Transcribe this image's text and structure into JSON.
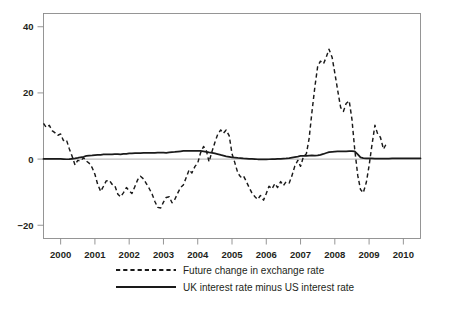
{
  "chart_data": {
    "type": "line",
    "title": "",
    "subtitle": "",
    "xlabel": "",
    "ylabel": "",
    "xlim": [
      1999.5,
      2010.5
    ],
    "ylim": [
      -24,
      44
    ],
    "yticks": [
      -20,
      0,
      20,
      40
    ],
    "ytick_labels": [
      "−20",
      "0",
      "20",
      "40"
    ],
    "xticks": [
      2000,
      2001,
      2002,
      2003,
      2004,
      2005,
      2006,
      2007,
      2008,
      2009,
      2010
    ],
    "xtick_labels": [
      "2000",
      "2001",
      "2002",
      "2003",
      "2004",
      "2005",
      "2006",
      "2007",
      "2008",
      "2009",
      "2010"
    ],
    "grid": false,
    "zero_reference_line": true,
    "legend_position": "below-axes",
    "series": [
      {
        "name": "Future change in exchange rate",
        "style": "dashed",
        "color": "#1a1a1a",
        "x": [
          1999.5,
          1999.58,
          1999.67,
          1999.75,
          1999.83,
          1999.92,
          2000.0,
          2000.08,
          2000.17,
          2000.25,
          2000.33,
          2000.42,
          2000.5,
          2000.58,
          2000.67,
          2000.75,
          2000.83,
          2000.92,
          2001.0,
          2001.08,
          2001.17,
          2001.25,
          2001.33,
          2001.42,
          2001.5,
          2001.58,
          2001.67,
          2001.75,
          2001.83,
          2001.92,
          2002.0,
          2002.08,
          2002.17,
          2002.25,
          2002.33,
          2002.42,
          2002.5,
          2002.58,
          2002.67,
          2002.75,
          2002.83,
          2002.92,
          2003.0,
          2003.08,
          2003.17,
          2003.25,
          2003.33,
          2003.42,
          2003.5,
          2003.58,
          2003.67,
          2003.75,
          2003.83,
          2003.92,
          2004.0,
          2004.08,
          2004.17,
          2004.25,
          2004.33,
          2004.42,
          2004.5,
          2004.58,
          2004.67,
          2004.75,
          2004.83,
          2004.92,
          2005.0,
          2005.08,
          2005.17,
          2005.25,
          2005.33,
          2005.42,
          2005.5,
          2005.58,
          2005.67,
          2005.75,
          2005.83,
          2005.92,
          2006.0,
          2006.08,
          2006.17,
          2006.25,
          2006.33,
          2006.42,
          2006.5,
          2006.58,
          2006.67,
          2006.75,
          2006.83,
          2006.92,
          2007.0,
          2007.08,
          2007.17,
          2007.25,
          2007.33,
          2007.42,
          2007.5,
          2007.58,
          2007.67,
          2007.75,
          2007.83,
          2007.92,
          2008.0,
          2008.08,
          2008.17,
          2008.25,
          2008.33,
          2008.42,
          2008.5,
          2008.58,
          2008.67,
          2008.75,
          2008.83,
          2008.92,
          2009.0,
          2009.08,
          2009.17,
          2009.25,
          2009.33,
          2009.42,
          2009.5
        ],
        "y": [
          10.8,
          9.6,
          10.2,
          8.6,
          8.0,
          7.2,
          7.6,
          5.6,
          5.8,
          3.2,
          1.0,
          -1.8,
          -0.4,
          -0.6,
          0.4,
          -0.6,
          -1.2,
          -2.6,
          -4.6,
          -7.6,
          -9.8,
          -8.2,
          -6.6,
          -6.4,
          -7.6,
          -8.0,
          -10.6,
          -11.4,
          -10.2,
          -8.6,
          -9.6,
          -10.4,
          -8.2,
          -6.2,
          -5.2,
          -6.0,
          -7.4,
          -8.8,
          -10.6,
          -12.8,
          -14.6,
          -14.8,
          -13.0,
          -11.6,
          -11.4,
          -13.2,
          -12.2,
          -10.2,
          -8.6,
          -7.8,
          -5.4,
          -3.2,
          -4.2,
          -2.2,
          -1.2,
          1.8,
          3.8,
          2.6,
          -0.8,
          2.4,
          5.0,
          7.4,
          8.8,
          7.8,
          8.8,
          7.0,
          1.6,
          -1.0,
          -4.2,
          -5.4,
          -5.0,
          -6.8,
          -8.6,
          -10.2,
          -11.4,
          -12.2,
          -11.0,
          -12.4,
          -10.4,
          -8.2,
          -9.0,
          -7.4,
          -8.6,
          -6.8,
          -8.0,
          -6.8,
          -7.2,
          -5.0,
          -2.2,
          -0.4,
          -2.2,
          0.6,
          1.6,
          6.2,
          14.0,
          22.0,
          28.0,
          29.6,
          28.8,
          30.8,
          33.2,
          30.8,
          26.0,
          21.0,
          15.6,
          14.4,
          16.8,
          17.6,
          12.0,
          3.0,
          -5.0,
          -9.2,
          -10.2,
          -7.0,
          -2.0,
          4.0,
          10.2,
          7.6,
          6.6,
          3.0,
          4.6
        ]
      },
      {
        "name": "UK interest rate minus US interest rate",
        "style": "solid",
        "color": "#1a1a1a",
        "x": [
          1999.5,
          1999.58,
          1999.67,
          1999.75,
          1999.83,
          1999.92,
          2000.0,
          2000.08,
          2000.17,
          2000.25,
          2000.33,
          2000.42,
          2000.5,
          2000.58,
          2000.67,
          2000.75,
          2000.83,
          2000.92,
          2001.0,
          2001.08,
          2001.17,
          2001.25,
          2001.33,
          2001.42,
          2001.5,
          2001.58,
          2001.67,
          2001.75,
          2001.83,
          2001.92,
          2002.0,
          2002.08,
          2002.17,
          2002.25,
          2002.33,
          2002.42,
          2002.5,
          2002.58,
          2002.67,
          2002.75,
          2002.83,
          2002.92,
          2003.0,
          2003.08,
          2003.17,
          2003.25,
          2003.33,
          2003.42,
          2003.5,
          2003.58,
          2003.67,
          2003.75,
          2003.83,
          2003.92,
          2004.0,
          2004.08,
          2004.17,
          2004.25,
          2004.33,
          2004.42,
          2004.5,
          2004.58,
          2004.67,
          2004.75,
          2004.83,
          2004.92,
          2005.0,
          2005.08,
          2005.17,
          2005.25,
          2005.33,
          2005.42,
          2005.5,
          2005.58,
          2005.67,
          2005.75,
          2005.83,
          2005.92,
          2006.0,
          2006.08,
          2006.17,
          2006.25,
          2006.33,
          2006.42,
          2006.5,
          2006.58,
          2006.67,
          2006.75,
          2006.83,
          2006.92,
          2007.0,
          2007.08,
          2007.17,
          2007.25,
          2007.33,
          2007.42,
          2007.5,
          2007.58,
          2007.67,
          2007.75,
          2007.83,
          2007.92,
          2008.0,
          2008.08,
          2008.17,
          2008.25,
          2008.33,
          2008.42,
          2008.5,
          2008.58,
          2008.67,
          2008.75,
          2008.83,
          2008.92,
          2009.0,
          2009.08,
          2009.17,
          2009.25,
          2009.33,
          2009.42,
          2009.5,
          2009.58,
          2009.67,
          2009.75,
          2009.83,
          2009.92,
          2010.0,
          2010.08,
          2010.17,
          2010.25,
          2010.33,
          2010.42,
          2010.5
        ],
        "y": [
          0.05,
          0.05,
          0.05,
          0.05,
          0.05,
          0.05,
          0.05,
          0.0,
          -0.05,
          0.0,
          0.1,
          0.2,
          0.35,
          0.55,
          0.7,
          0.95,
          1.05,
          1.1,
          1.2,
          1.25,
          1.3,
          1.4,
          1.45,
          1.4,
          1.45,
          1.5,
          1.5,
          1.45,
          1.55,
          1.6,
          1.75,
          1.75,
          1.8,
          1.8,
          1.8,
          1.85,
          1.85,
          1.85,
          1.9,
          1.9,
          1.95,
          1.95,
          1.95,
          1.9,
          2.0,
          2.1,
          2.15,
          2.25,
          2.35,
          2.45,
          2.5,
          2.5,
          2.5,
          2.5,
          2.5,
          2.45,
          2.35,
          2.2,
          2.05,
          1.9,
          1.7,
          1.5,
          1.25,
          1.05,
          0.85,
          0.7,
          0.55,
          0.45,
          0.35,
          0.3,
          0.2,
          0.15,
          0.1,
          0.05,
          0.0,
          -0.05,
          -0.05,
          -0.1,
          -0.1,
          -0.05,
          0.0,
          0.0,
          0.05,
          0.1,
          0.15,
          0.2,
          0.3,
          0.45,
          0.6,
          0.75,
          0.95,
          1.0,
          1.0,
          1.05,
          1.1,
          1.05,
          1.1,
          1.3,
          1.55,
          1.85,
          2.1,
          2.2,
          2.25,
          2.3,
          2.3,
          2.3,
          2.35,
          2.4,
          2.4,
          2.35,
          1.4,
          0.5,
          0.3,
          0.25,
          0.2,
          0.2,
          0.15,
          0.15,
          0.15,
          0.15,
          0.15,
          0.15,
          0.2,
          0.2,
          0.2,
          0.2,
          0.2,
          0.2,
          0.2,
          0.2,
          0.2,
          0.2,
          0.2
        ]
      }
    ]
  },
  "legend": {
    "entries": [
      {
        "label": "Future change in exchange rate",
        "style": "dashed"
      },
      {
        "label": "UK interest rate minus US interest rate",
        "style": "solid"
      }
    ]
  }
}
